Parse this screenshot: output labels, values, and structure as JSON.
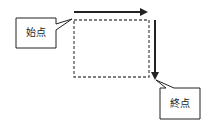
{
  "diagram": {
    "start_label": "始点",
    "end_label": "終点",
    "colors": {
      "stroke": "#222222",
      "background": "#ffffff"
    }
  }
}
